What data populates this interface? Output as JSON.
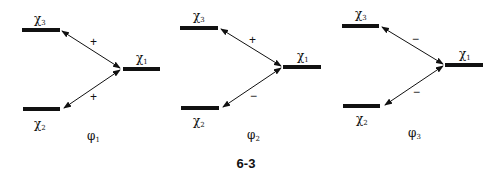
{
  "figure": {
    "caption": "6-3",
    "panels": [
      {
        "name": "phi1",
        "phi_label": "φ",
        "phi_sub": "1",
        "levels": {
          "top": {
            "chi": "χ",
            "sub": "3"
          },
          "right": {
            "chi": "χ",
            "sub": "1"
          },
          "bottom": {
            "chi": "χ",
            "sub": "2"
          }
        },
        "top_sign": "+",
        "bottom_sign": "+"
      },
      {
        "name": "phi2",
        "phi_label": "φ",
        "phi_sub": "2",
        "levels": {
          "top": {
            "chi": "χ",
            "sub": "3"
          },
          "right": {
            "chi": "χ",
            "sub": "1"
          },
          "bottom": {
            "chi": "χ",
            "sub": "2"
          }
        },
        "top_sign": "+",
        "bottom_sign": "−"
      },
      {
        "name": "phi3",
        "phi_label": "φ",
        "phi_sub": "3",
        "levels": {
          "top": {
            "chi": "χ",
            "sub": "3"
          },
          "right": {
            "chi": "χ",
            "sub": "1"
          },
          "bottom": {
            "chi": "χ",
            "sub": "2"
          }
        },
        "top_sign": "−",
        "bottom_sign": "−"
      }
    ]
  }
}
